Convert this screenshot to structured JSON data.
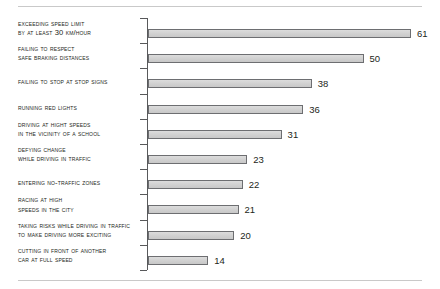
{
  "chart_data": {
    "type": "bar",
    "orientation": "horizontal",
    "title": "",
    "subtitle": "",
    "xlabel": "",
    "ylabel": "",
    "grid": false,
    "legend": null,
    "xlim": [
      0,
      61
    ],
    "axis": "vertical category axis with leftward tick marks between bars",
    "categories": [
      "Exceeding speed limit by at least 30 km/hour",
      "Failing to respect safe braking distances",
      "Failing to stop at stop signs",
      "Running red lights",
      "Driving at hight speeds in the vicinity of a school",
      "Defying change while driving in traffic",
      "Entering no-traffic zones",
      "Racing at high speeds in the city",
      "Taking risks while driving in traffic to make driving more exciting",
      "Cutting in front of another car at full speed"
    ],
    "values": [
      61,
      50,
      38,
      36,
      31,
      23,
      22,
      21,
      20,
      14
    ],
    "bars": [
      {
        "lines": [
          "Exceeding speed limit",
          "by at least 30 km/hour"
        ],
        "value": 61,
        "value_label": "61"
      },
      {
        "lines": [
          "Failing to respect",
          "safe braking distances"
        ],
        "value": 50,
        "value_label": "50"
      },
      {
        "lines": [
          "Failing to stop at stop signs"
        ],
        "value": 38,
        "value_label": "38"
      },
      {
        "lines": [
          "Running red lights"
        ],
        "value": 36,
        "value_label": "36"
      },
      {
        "lines": [
          "Driving at hight speeds",
          "in the vicinity of a school"
        ],
        "value": 31,
        "value_label": "31"
      },
      {
        "lines": [
          "Defying change",
          "while driving in traffic"
        ],
        "value": 23,
        "value_label": "23"
      },
      {
        "lines": [
          "Entering no-traffic zones"
        ],
        "value": 22,
        "value_label": "22"
      },
      {
        "lines": [
          "Racing at high",
          "speeds in the city"
        ],
        "value": 21,
        "value_label": "21"
      },
      {
        "lines": [
          "Taking risks while driving in traffic",
          "to make driving more exciting"
        ],
        "value": 20,
        "value_label": "20"
      },
      {
        "lines": [
          "Cutting in front of another",
          "car at full speed"
        ],
        "value": 14,
        "value_label": "14"
      }
    ]
  },
  "style": {
    "bar_fill": "#d2d2d2",
    "bar_stroke": "#6d6e71",
    "axis_color": "#58595b",
    "rule_color": "#c9c9c9",
    "text_color": "#231f20",
    "background": "#ffffff"
  }
}
